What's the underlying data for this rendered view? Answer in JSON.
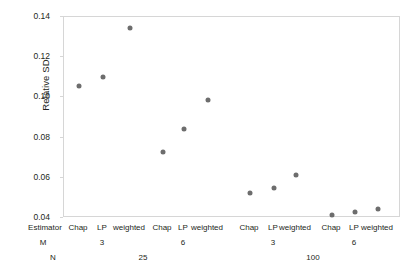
{
  "chart_data": {
    "type": "scatter",
    "title": "",
    "xlabel": "",
    "ylabel": "Relative SD",
    "ylim": [
      0.04,
      0.14
    ],
    "yticks": [
      0.14,
      0.12,
      0.1,
      0.08,
      0.06,
      0.04
    ],
    "ytick_labels": [
      "0.14",
      "0.12",
      "0.10",
      "0.08",
      "0.06",
      "0.04"
    ],
    "grid": false,
    "legend": "none",
    "marker_color": "#6d6d6d",
    "frame_color": "#d6d6d6",
    "axis_rows": {
      "estimator_header": "Estimator",
      "m_header": "M",
      "n_header": "N"
    },
    "categories": [
      "Chap",
      "LP",
      "weighted",
      "Chap",
      "LP",
      "weighted",
      "Chap",
      "LP",
      "weighted",
      "Chap",
      "LP",
      "weighted"
    ],
    "values": [
      0.1057,
      0.1102,
      0.1347,
      0.0728,
      0.0843,
      0.0987,
      0.0524,
      0.0549,
      0.0614,
      0.0415,
      0.043,
      0.0445
    ],
    "groups_m": [
      "3",
      "6",
      "3",
      "6"
    ],
    "groups_n": [
      "25",
      "100"
    ],
    "points": [
      {
        "estimator": "Chap",
        "m": "3",
        "n": "25",
        "value": 0.1057,
        "x_px": 78,
        "y_px": 84
      },
      {
        "estimator": "LP",
        "m": "3",
        "n": "25",
        "value": 0.1102,
        "x_px": 102,
        "y_px": 75
      },
      {
        "estimator": "weighted",
        "m": "3",
        "n": "25",
        "value": 0.1347,
        "x_px": 129,
        "y_px": 29
      },
      {
        "estimator": "Chap",
        "m": "6",
        "n": "25",
        "value": 0.0728,
        "x_px": 162,
        "y_px": 151
      },
      {
        "estimator": "LP",
        "m": "6",
        "n": "25",
        "value": 0.0843,
        "x_px": 183,
        "y_px": 128
      },
      {
        "estimator": "weighted",
        "m": "6",
        "n": "25",
        "value": 0.0987,
        "x_px": 207,
        "y_px": 99
      },
      {
        "estimator": "Chap",
        "m": "3",
        "n": "100",
        "value": 0.0524,
        "x_px": 249,
        "y_px": 192
      },
      {
        "estimator": "LP",
        "m": "3",
        "n": "100",
        "value": 0.0549,
        "x_px": 273,
        "y_px": 187
      },
      {
        "estimator": "weighted",
        "m": "3",
        "n": "100",
        "value": 0.0614,
        "x_px": 295,
        "y_px": 174
      },
      {
        "estimator": "Chap",
        "m": "6",
        "n": "100",
        "value": 0.0415,
        "x_px": 331,
        "y_px": 217
      },
      {
        "estimator": "LP",
        "m": "6",
        "n": "100",
        "value": 0.043,
        "x_px": 354,
        "y_px": 214
      },
      {
        "estimator": "weighted",
        "m": "6",
        "n": "100",
        "value": 0.0445,
        "x_px": 377,
        "y_px": 211
      }
    ],
    "m_label_x_px": [
      102,
      183,
      273,
      354
    ],
    "n_label_x_px": [
      143,
      313
    ]
  }
}
